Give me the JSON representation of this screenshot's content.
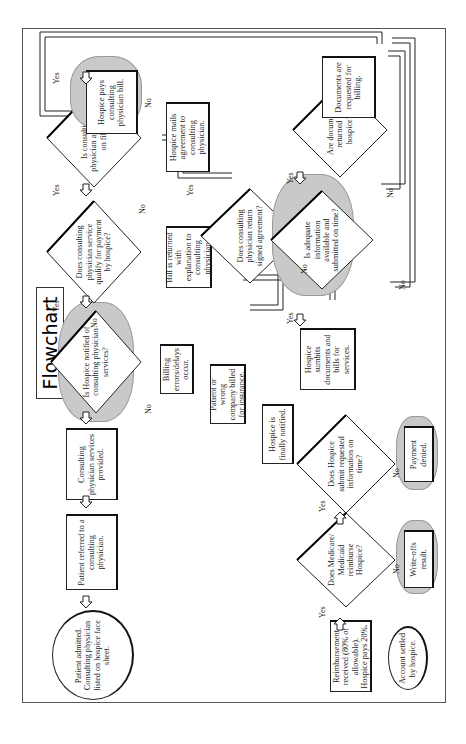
{
  "title": "Flowchart",
  "nodes": {
    "patient_admitted": "Patient admitted. Consulting physician listed on hospice face sheet.",
    "patient_referred": "Patient referred to a consulting physician.",
    "services_provided": "Consulting physician services provided.",
    "hospice_notified_q": "Is Hospice notified of consulting physician services?",
    "qualify_q": "Does consulting physician service qualify for payment by hospice?",
    "agreement_q": "Is consulting physician agreement on file?",
    "hospice_pays": "Hospice pays consulting physician bill.",
    "billing_errors": "Billing errors/delays occur.",
    "wrong_company": "Patient or wrong company billed for insurance.",
    "finally_notified": "Hospice is finally notified.",
    "bill_returned": "Bill is returned with explanation to consulting physician.",
    "mails_agreement": "Hospice mails agreement to consulting physician.",
    "return_signed_q": "Does consulting physician return signed agreement?",
    "submits_documents": "Hospice sumbits documents and bills for services.",
    "adequate_info_q": "Is adequate information available and submitted on time?",
    "documents_returned_q": "Are documents returned to hospice?",
    "documents_requested": "Documents are requested for billing.",
    "submit_requested_q": "Does Hospice submit requested information on time?",
    "payment_denied": "Payment denied.",
    "medicare_q": "Does Medicare/ Medicaid reimburse Hospice?",
    "write_offs": "Write-offs result.",
    "reimbursement": "Reimbursement received (80% of allowable). Hospice pays 20%.",
    "account_settled": "Account settled by hospice."
  },
  "labels": {
    "yes": "Yes",
    "no": "No"
  },
  "colors": {
    "cloud": "#c9c9c9",
    "line": "#222222"
  }
}
